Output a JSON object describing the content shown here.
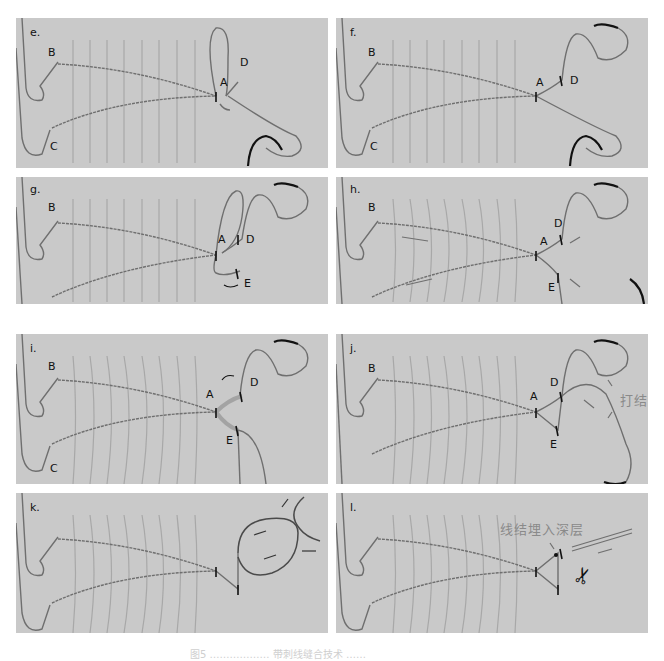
{
  "figure": {
    "panels": [
      {
        "id": "e",
        "label": "e.",
        "points": {
          "B": "B",
          "C": "C",
          "A": "A",
          "D": "D"
        }
      },
      {
        "id": "f",
        "label": "f.",
        "points": {
          "B": "B",
          "C": "C",
          "A": "A",
          "D": "D"
        }
      },
      {
        "id": "g",
        "label": "g.",
        "points": {
          "B": "B",
          "C": "C",
          "A": "A",
          "D": "D",
          "E": "E"
        }
      },
      {
        "id": "h",
        "label": "h.",
        "points": {
          "B": "B",
          "C": "C",
          "A": "A",
          "D": "D",
          "E": "E"
        }
      },
      {
        "id": "i",
        "label": "i.",
        "points": {
          "B": "B",
          "C": "C",
          "A": "A",
          "D": "D",
          "E": "E"
        }
      },
      {
        "id": "j",
        "label": "j.",
        "points": {
          "B": "B",
          "C": "C",
          "A": "A",
          "D": "D",
          "E": "E"
        },
        "annotation": "打结"
      },
      {
        "id": "k",
        "label": "k."
      },
      {
        "id": "l",
        "label": "l.",
        "annotation": "线结埋入深层"
      }
    ],
    "caption": "图5 ……………… 带刺线缝合技术 ……"
  },
  "colors": {
    "panel_bg": "#c9c9c9",
    "suture": "#6f6f6f",
    "needle": "#111111",
    "wound_lines": "#a8a8a8"
  }
}
